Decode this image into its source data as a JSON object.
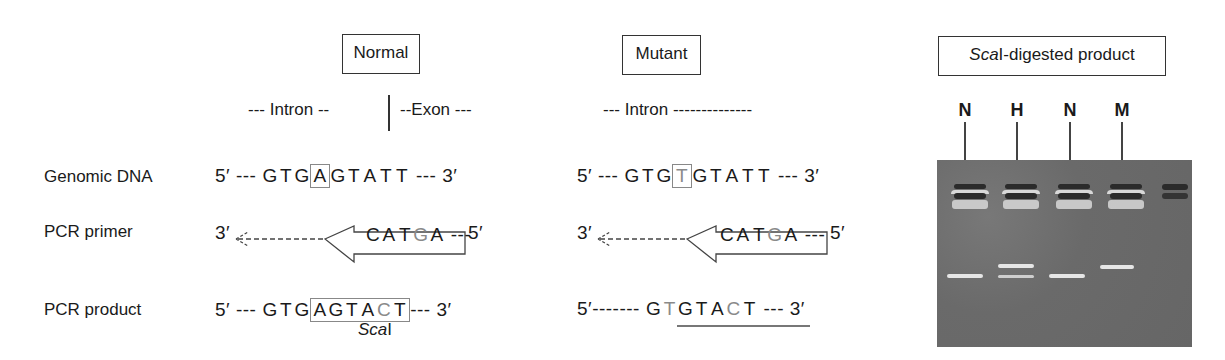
{
  "headers": {
    "normal": "Normal",
    "mutant": "Mutant",
    "gel_title_italic": "Sca",
    "gel_title_rest": "I-digested product"
  },
  "regions": {
    "normal_intron": "--- Intron --",
    "normal_exon": "--Exon ---",
    "mutant_intron": "--- Intron --------------"
  },
  "row_labels": {
    "genomic": "Genomic DNA",
    "primer": "PCR primer",
    "product": "PCR product"
  },
  "normal": {
    "genomic": {
      "left": "5′ ---",
      "pre": [
        "G",
        "T",
        "G"
      ],
      "boxed": "A",
      "post": [
        "G",
        "T",
        "A",
        "T",
        "T"
      ],
      "right": "--- 3′"
    },
    "primer": {
      "left": "3′",
      "bases": [
        "C",
        "A",
        "T",
        "G",
        "A"
      ],
      "grey_index": 3,
      "tail": "---",
      "right": "5′"
    },
    "product": {
      "left": "5′ ---",
      "pre": [
        "G",
        "T",
        "G"
      ],
      "boxed": [
        "A",
        "G",
        "T",
        "A",
        "C",
        "T"
      ],
      "grey_index": 4,
      "right": "--- 3′",
      "site_italic": "Sca",
      "site_rest": "I"
    }
  },
  "mutant": {
    "genomic": {
      "left": "5′ ---",
      "pre": [
        "G",
        "T",
        "G"
      ],
      "boxed": "T",
      "post": [
        "G",
        "T",
        "A",
        "T",
        "T"
      ],
      "right": "--- 3′"
    },
    "primer": {
      "left": "3′",
      "bases": [
        "C",
        "A",
        "T",
        "G",
        "A"
      ],
      "grey_index": 3,
      "tail": "---",
      "right": "5′"
    },
    "product": {
      "left": "5′-------",
      "bases": [
        "G",
        "T",
        "G",
        "T",
        "A",
        "C",
        "T"
      ],
      "grey_indices": [
        1,
        5
      ],
      "right": "--- 3′"
    }
  },
  "gel": {
    "lanes": [
      "N",
      "H",
      "N",
      "M"
    ],
    "colors": {
      "gel": "#6e6e6e",
      "well_dark": "#2b2b2b",
      "band_light": "#e6e6e6"
    }
  }
}
